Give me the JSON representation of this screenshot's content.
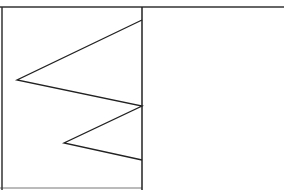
{
  "diagram": {
    "type": "zigzag-polyline",
    "stroke_color": "#222222",
    "border_color": "#333333",
    "background": "#ffffff",
    "frame": {
      "top_y": 7,
      "bottom_y": 188,
      "left_x": 2,
      "divider_x": 142
    },
    "polyline": [
      {
        "x": 142,
        "y": 20
      },
      {
        "x": 17,
        "y": 80
      },
      {
        "x": 142,
        "y": 106
      },
      {
        "x": 64,
        "y": 143
      },
      {
        "x": 142,
        "y": 160
      }
    ]
  }
}
